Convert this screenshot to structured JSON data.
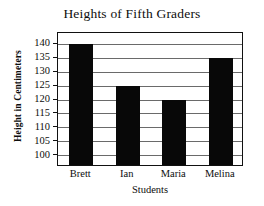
{
  "chart_data": {
    "type": "bar",
    "title": "Heights of Fifth Graders",
    "xlabel": "Students",
    "ylabel": "Height in Centimeters",
    "categories": [
      "Brett",
      "Ian",
      "Maria",
      "Melina"
    ],
    "values": [
      140,
      125,
      120,
      135
    ],
    "yticks": [
      100,
      105,
      110,
      115,
      120,
      125,
      130,
      135,
      140
    ],
    "ytick_labels": [
      "100",
      "105",
      "110",
      "115",
      "120",
      "125",
      "130",
      "135",
      "140"
    ],
    "ylim": [
      96,
      144
    ],
    "grid": true,
    "legend": false,
    "bar_color": "#080808",
    "axis_color": "#111111",
    "grid_color": "#6a6a6a",
    "background": "#ffffff"
  }
}
